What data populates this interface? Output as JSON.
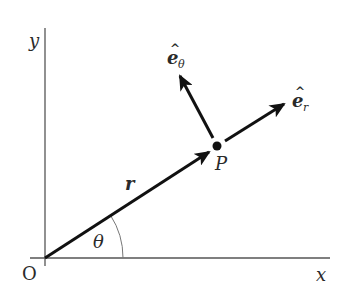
{
  "diagram": {
    "colors": {
      "axis": "#555555",
      "vector": "#111111",
      "arc": "#777777",
      "text": "#2a2a2a"
    },
    "labels": {
      "y_axis": "y",
      "x_axis": "x",
      "origin": "O",
      "point": "P",
      "radius": "r",
      "angle": "θ",
      "e_theta_base": "e",
      "e_theta_hat": "^",
      "e_theta_sub": "θ",
      "e_r_base": "e",
      "e_r_hat": "^",
      "e_r_sub": "r"
    },
    "geometry": {
      "origin": [
        45,
        258
      ],
      "point_P": [
        217,
        147
      ],
      "e_r_tip": [
        284,
        104
      ],
      "e_theta_tip": [
        180,
        75
      ],
      "theta_arc_radius": 78
    }
  }
}
